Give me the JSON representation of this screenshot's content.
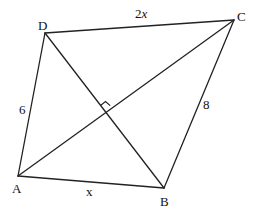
{
  "diagram": {
    "vertices": {
      "A": {
        "label": "A",
        "x": 18,
        "y": 176
      },
      "B": {
        "label": "B",
        "x": 164,
        "y": 188
      },
      "C": {
        "label": "C",
        "x": 234,
        "y": 20
      },
      "D": {
        "label": "D",
        "x": 45,
        "y": 33
      }
    },
    "sides": {
      "AB": {
        "label": "x"
      },
      "BC": {
        "label": "8"
      },
      "CD": {
        "label_num": "2",
        "label_var": "x"
      },
      "DA": {
        "label": "6"
      }
    },
    "diagonals": [
      "AC",
      "BD"
    ],
    "annotations": {
      "right_angle": "Diagonals AC and BD are perpendicular"
    },
    "colors": {
      "stroke": "#222222",
      "text": "#111111",
      "background": "#ffffff"
    }
  }
}
